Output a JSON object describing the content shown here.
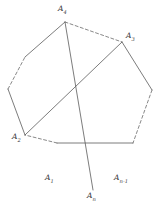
{
  "figure": {
    "kind": "geometry-diagram",
    "stroke_color": "#5a5a5a",
    "dashed_stroke_color": "#6a6a6a",
    "label_color": "#3a3a3a",
    "background": "#ffffff",
    "stroke_width": 0.8
  },
  "labels": {
    "a4": {
      "base": "A",
      "sub": "4"
    },
    "a3": {
      "base": "A",
      "sub": "3"
    },
    "a2": {
      "base": "A",
      "sub": "2"
    },
    "a1": {
      "base": "A",
      "sub": "1"
    },
    "an": {
      "base": "A",
      "sub": "n"
    },
    "an_minus_1": {
      "base": "A",
      "sub": "n-1"
    }
  },
  "geometry": {
    "vertices": [
      {
        "name": "A4",
        "x": 65,
        "y": 22
      },
      {
        "name": "A3",
        "x": 122,
        "y": 42
      },
      {
        "name": "V_r1",
        "x": 152,
        "y": 90
      },
      {
        "name": "An-1",
        "x": 133,
        "y": 143
      },
      {
        "name": "A1",
        "x": 57,
        "y": 143
      },
      {
        "name": "A2",
        "x": 25,
        "y": 135
      },
      {
        "name": "V_l1",
        "x": 8,
        "y": 89
      },
      {
        "name": "V_l2",
        "x": 25,
        "y": 57
      }
    ],
    "edges": [
      {
        "from": "A4",
        "to": "A3",
        "style": "dashed"
      },
      {
        "from": "A3",
        "to": "V_r1",
        "style": "solid"
      },
      {
        "from": "V_r1",
        "to": "An-1",
        "style": "dashed"
      },
      {
        "from": "An-1",
        "to": "A1",
        "style": "solid"
      },
      {
        "from": "A1",
        "to": "A2",
        "style": "dashed"
      },
      {
        "from": "A2",
        "to": "V_l1",
        "style": "solid"
      },
      {
        "from": "V_l1",
        "to": "V_l2",
        "style": "dashed"
      },
      {
        "from": "V_l2",
        "to": "A4",
        "style": "solid"
      }
    ],
    "diagonals": [
      {
        "name": "A4-An",
        "from": {
          "x": 65,
          "y": 22
        },
        "to": {
          "x": 93,
          "y": 190
        },
        "style": "solid"
      },
      {
        "name": "A2-A3",
        "from": {
          "x": 25,
          "y": 135
        },
        "to": {
          "x": 122,
          "y": 42
        },
        "style": "solid"
      }
    ],
    "label_positions": {
      "a4": {
        "left": 58,
        "top": 5
      },
      "a3": {
        "left": 126,
        "top": 32
      },
      "a2": {
        "left": 12,
        "top": 133
      },
      "a1": {
        "left": 45,
        "top": 174
      },
      "an": {
        "left": 87,
        "top": 192
      },
      "an_minus_1": {
        "left": 114,
        "top": 174
      }
    }
  }
}
